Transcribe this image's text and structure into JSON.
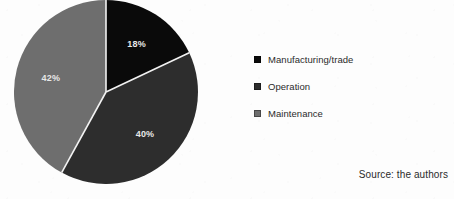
{
  "figure": {
    "background_color": "#fdfdfd",
    "source_note": "Source: the authors"
  },
  "chart_data": {
    "type": "pie",
    "title": "",
    "subtitle": "",
    "xlabel": "",
    "ylabel": "",
    "categories": [
      "Manufacturing/trade",
      "Operation",
      "Maintenance"
    ],
    "values": [
      18,
      40,
      42
    ],
    "value_unit": "%",
    "data_labels": [
      "18%",
      "40%",
      "42%"
    ],
    "colors": [
      "#0a0a0a",
      "#2d2d2d",
      "#6e6e6e"
    ],
    "slice_label_color": "#e8e8e8",
    "separator_color": "#f2f2f2",
    "start_angle_deg": 0,
    "direction": "clockwise",
    "legend_position": "right",
    "legend": [
      {
        "label": "Manufacturing/trade",
        "color": "#0a0a0a",
        "value": 18,
        "data_label": "18%"
      },
      {
        "label": "Operation",
        "color": "#2d2d2d",
        "value": 40,
        "data_label": "40%"
      },
      {
        "label": "Maintenance",
        "color": "#6e6e6e",
        "value": 42,
        "data_label": "42%"
      }
    ],
    "grid": false
  }
}
